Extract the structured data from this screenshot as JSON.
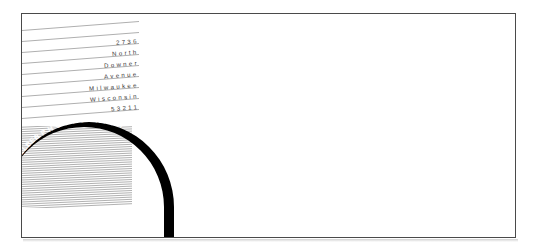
{
  "artwork": {
    "title": "Dennis Felber Photography letterhead design",
    "background_color": "#ffffff",
    "frame_border_color": "#4a4a4a",
    "ink_color": "#000000",
    "rule_line_color": "#8d8d8d",
    "hatch_color": "#6f6f6f",
    "text_color": "#33322f"
  },
  "address": {
    "lines": [
      "2736",
      "North",
      "Downer",
      "Avenue",
      "Milwaukee",
      "Wisconsin",
      "53211"
    ]
  },
  "logo": {
    "name": "DENNIS FELBER",
    "word": "PHOTOGRAPHY",
    "curved_text": "DENNIS FELBER P H O T O G R A P H Y",
    "ring_color": "#000000",
    "ring_text_color": "#ffffff"
  }
}
